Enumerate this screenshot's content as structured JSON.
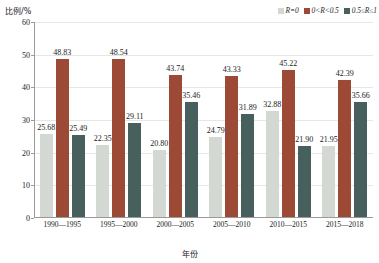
{
  "chart_data": {
    "type": "bar",
    "title": "",
    "xlabel": "年份",
    "ylabel": "比例/%",
    "ylim": [
      0,
      60
    ],
    "yticks": [
      0,
      10,
      20,
      30,
      40,
      50,
      60
    ],
    "grid": true,
    "legend_position": "top-right",
    "categories": [
      "1990—1995",
      "1995—2000",
      "2000—2005",
      "2005—2010",
      "2010—2015",
      "2015—2018"
    ],
    "series": [
      {
        "name": "R=0",
        "color": "#d3d8d3",
        "values": [
          25.68,
          22.35,
          20.8,
          24.79,
          32.88,
          21.95
        ]
      },
      {
        "name": "0<R<0.5",
        "color": "#9c4a35",
        "values": [
          48.83,
          48.54,
          43.74,
          43.33,
          45.22,
          42.39
        ]
      },
      {
        "name": "0.5≤R≤1",
        "color": "#475f5d",
        "values": [
          25.49,
          29.11,
          35.46,
          31.89,
          21.9,
          35.66
        ]
      }
    ]
  }
}
